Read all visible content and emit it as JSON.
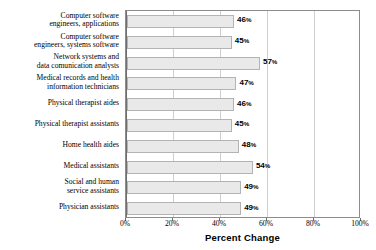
{
  "chart_data": {
    "type": "bar",
    "orientation": "horizontal",
    "title": "",
    "xlabel": "Percent Change",
    "ylabel": "",
    "xlim": [
      0,
      100
    ],
    "xticks": [
      "0%",
      "20%",
      "40%",
      "60%",
      "80%",
      "100%"
    ],
    "xtick_values": [
      0,
      20,
      40,
      60,
      80,
      100
    ],
    "grid": true,
    "legend": false,
    "bar_fill_color": "#e9e9e9",
    "bar_border_color": "#b3b3b3",
    "categories": [
      "Computer software engineers, applications",
      "Computer software engineers, systems software",
      "Network systems and data comunication analysts",
      "Medical records and health information technicians",
      "Physical therapist aides",
      "Physical therapist assistants",
      "Home health aides",
      "Medical assistants",
      "Social and human service assistants",
      "Physician assistants"
    ],
    "category_lines": [
      [
        "Computer software",
        "engineers, applications"
      ],
      [
        "Computer software",
        "engineers, systems software"
      ],
      [
        "Network systems and",
        "data comunication analysts"
      ],
      [
        "Medical records and health",
        "information technicians"
      ],
      [
        "Physical therapist aides"
      ],
      [
        "Physical therapist assistants"
      ],
      [
        "Home health aides"
      ],
      [
        "Medical assistants"
      ],
      [
        "Social and human",
        "service assistants"
      ],
      [
        "Physician assistants"
      ]
    ],
    "values": [
      46,
      45,
      57,
      47,
      46,
      45,
      48,
      54,
      49,
      49
    ],
    "value_labels": [
      "46%",
      "45%",
      "57%",
      "47%",
      "46%",
      "45%",
      "48%",
      "54%",
      "49%",
      "49%"
    ]
  }
}
